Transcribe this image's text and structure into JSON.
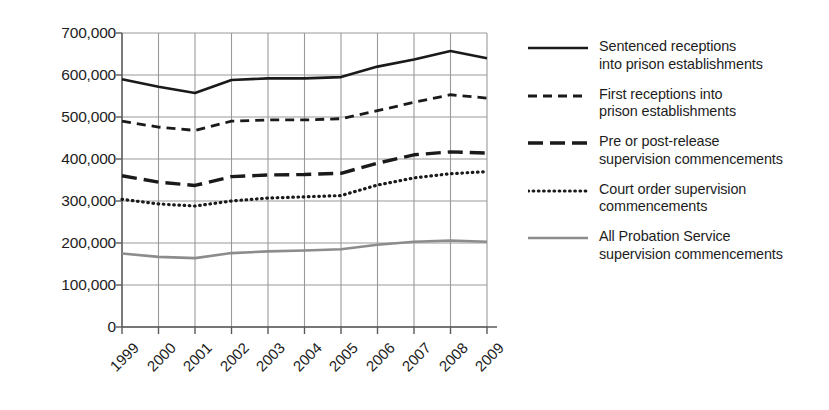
{
  "chart_data": {
    "type": "line",
    "title": "",
    "xlabel": "",
    "ylabel": "",
    "x": [
      "1999",
      "2000",
      "2001",
      "2002",
      "2003",
      "2004",
      "2005",
      "2006",
      "2007",
      "2008",
      "2009"
    ],
    "xlim": [
      1999,
      2009
    ],
    "ylim": [
      0,
      700000
    ],
    "y_ticks": [
      0,
      100000,
      200000,
      300000,
      400000,
      500000,
      600000,
      700000
    ],
    "y_tick_labels": [
      "0",
      "100,000",
      "200,000",
      "300,000",
      "400,000",
      "500,000",
      "600,000",
      "700,000"
    ],
    "grid": "both",
    "legend_position": "right",
    "series": [
      {
        "name": "Sentenced receptions into prison establishments",
        "label_lines": [
          "Sentenced receptions",
          "into prison establishments"
        ],
        "style": "solid",
        "color": "#1a1a1a",
        "width": 2.6,
        "values": [
          590000,
          572000,
          557000,
          588000,
          592000,
          592000,
          595000,
          620000,
          637000,
          657000,
          640000
        ]
      },
      {
        "name": "First receptions into prison establishments",
        "label_lines": [
          "First receptions into",
          "prison establishments"
        ],
        "style": "dashed-short",
        "color": "#1a1a1a",
        "width": 2.8,
        "dasharray": "9,6",
        "values": [
          490000,
          476000,
          468000,
          490000,
          493000,
          493000,
          496000,
          515000,
          535000,
          553000,
          545000
        ]
      },
      {
        "name": "Pre or post-release supervision commencements",
        "label_lines": [
          "Pre or post-release",
          "supervision commencements"
        ],
        "style": "dashed-long",
        "color": "#1a1a1a",
        "width": 3.4,
        "dasharray": "15,7",
        "values": [
          360000,
          345000,
          337000,
          358000,
          362000,
          363000,
          366000,
          390000,
          410000,
          417000,
          414000
        ]
      },
      {
        "name": "Court order supervision commencements",
        "label_lines": [
          "Court order supervision",
          "commencements"
        ],
        "style": "dotted",
        "color": "#1a1a1a",
        "width": 3.2,
        "dasharray": "0.6,4.6",
        "values": [
          304000,
          293000,
          288000,
          300000,
          307000,
          310000,
          313000,
          338000,
          355000,
          365000,
          370000
        ]
      },
      {
        "name": "All Probation Service supervision commencements",
        "label_lines": [
          "All Probation Service",
          "supervision commencements"
        ],
        "style": "solid",
        "color": "#8c8c8c",
        "width": 2.6,
        "values": [
          175000,
          167000,
          164000,
          176000,
          180000,
          182000,
          185000,
          196000,
          203000,
          206000,
          203000
        ]
      }
    ]
  },
  "axis": {
    "color": "#6e6e6e",
    "grid_color": "#9a9a9a"
  }
}
